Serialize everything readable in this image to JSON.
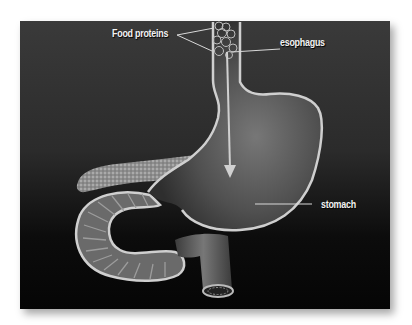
{
  "diagram": {
    "labels": {
      "food_proteins": "Food proteins",
      "esophagus": "esophagus",
      "stomach": "stomach"
    },
    "colors": {
      "background_top": "#3a3a3a",
      "background_bottom": "#050505",
      "organ_wall": "#c8c8c8",
      "organ_fill": "#5a5a5a",
      "label_text": "#f2f2f2",
      "arrow": "#d0d0d0"
    }
  }
}
